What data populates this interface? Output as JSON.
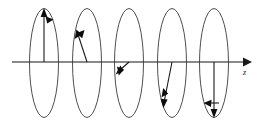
{
  "figure": {
    "background_color": "#ffffff",
    "ellipse_stroke_color": "#3a3a3a",
    "axis_color": "#8a8a8a",
    "vector_color": "#1a1a1a",
    "axis": {
      "label": "z",
      "label_x": 245,
      "label_y": 74,
      "start_x": 12,
      "end_x": 243,
      "y": 62,
      "arrow_tip_x": 252,
      "arrow_name": "z-axis-arrowhead"
    },
    "ellipse_geometry": {
      "rx": 14.5,
      "ry": 54.5,
      "cy": 63,
      "centers_x": [
        44,
        87,
        129,
        172,
        214
      ]
    },
    "ellipses": [
      {
        "name": "phase-1",
        "cx": 44,
        "vector_angle_deg": 90,
        "vector_label": "up",
        "tip_x": 44,
        "tip_y": 9,
        "rotation_marker_x": 49,
        "rotation_marker_y": 20,
        "rotation_marker_angle_deg": 20
      },
      {
        "name": "phase-2",
        "cx": 87,
        "vector_angle_deg": 140,
        "vector_label": "upper-left",
        "tip_x": 76,
        "tip_y": 30,
        "rotation_marker_x": 81,
        "rotation_marker_y": 33,
        "rotation_marker_angle_deg": 330
      },
      {
        "name": "phase-3",
        "cx": 129,
        "vector_angle_deg": 208,
        "vector_label": "lower-left",
        "tip_x": 117,
        "tip_y": 72,
        "rotation_marker_x": 120,
        "rotation_marker_y": 69,
        "rotation_marker_angle_deg": 250
      },
      {
        "name": "phase-4",
        "cx": 172,
        "vector_angle_deg": 250,
        "vector_label": "lower-left-steep",
        "tip_x": 163,
        "tip_y": 106,
        "rotation_marker_x": 165,
        "rotation_marker_y": 94,
        "rotation_marker_angle_deg": 255
      },
      {
        "name": "phase-5",
        "cx": 214,
        "vector_angle_deg": 270,
        "vector_label": "down",
        "tip_x": 214,
        "tip_y": 117,
        "rotation_marker_x": 206,
        "rotation_marker_y": 103,
        "rotation_marker_angle_deg": 180
      }
    ]
  }
}
